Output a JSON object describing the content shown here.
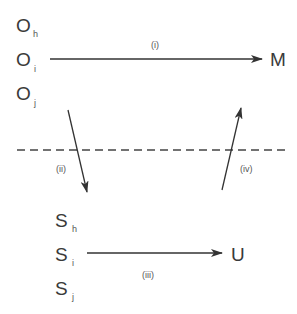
{
  "diagram": {
    "top_nodes": [
      {
        "base": "O",
        "sub": "h"
      },
      {
        "base": "O",
        "sub": "i"
      },
      {
        "base": "O",
        "sub": "j"
      }
    ],
    "top_target": "M",
    "bottom_nodes": [
      {
        "base": "S",
        "sub": "h"
      },
      {
        "base": "S",
        "sub": "i"
      },
      {
        "base": "S",
        "sub": "j"
      }
    ],
    "bottom_target": "U",
    "arrows": {
      "i": "(i)",
      "ii": "(ii)",
      "iii": "(iii)",
      "iv": "(iv)"
    },
    "colors": {
      "line": "#333333",
      "dash": "#444444"
    }
  }
}
